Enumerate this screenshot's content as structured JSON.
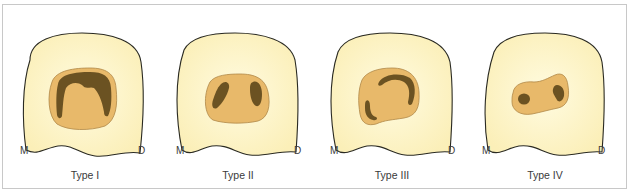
{
  "figure": {
    "colors": {
      "background": "#ffffff",
      "frame_border": "#c8c8c8",
      "crown_fill": "#fcf3c4",
      "crown_stroke": "#2a2a22",
      "pulp_chamber_fill": "#e8b96a",
      "pulp_chamber_stroke": "#b08848",
      "canal_fill": "#6b5222",
      "label_color": "#3a3a3a"
    },
    "panels": [
      {
        "type_label": "Type I",
        "mesial_label": "M",
        "distal_label": "D"
      },
      {
        "type_label": "Type II",
        "mesial_label": "M",
        "distal_label": "D"
      },
      {
        "type_label": "Type III",
        "mesial_label": "M",
        "distal_label": "D"
      },
      {
        "type_label": "Type IV",
        "mesial_label": "M",
        "distal_label": "D"
      }
    ]
  }
}
